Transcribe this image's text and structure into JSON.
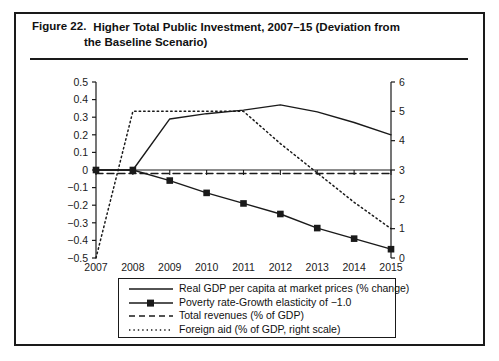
{
  "figure": {
    "number": "Figure 22.",
    "title_line1": "Higher Total Public Investment, 2007–15 (Deviation from",
    "title_line2": "the Baseline Scenario)"
  },
  "chart_data": {
    "type": "line",
    "title": "Higher Total Public Investment, 2007–15 (Deviation from the Baseline Scenario)",
    "xlabel": "",
    "ylabel": "",
    "categories": [
      "2007",
      "2008",
      "2009",
      "2010",
      "2011",
      "2012",
      "2013",
      "2014",
      "2015"
    ],
    "x": [
      2007,
      2008,
      2009,
      2010,
      2011,
      2012,
      2013,
      2014,
      2015
    ],
    "ylim": [
      -0.5,
      0.5
    ],
    "yticks": [
      "0.5",
      "0.4",
      "0.3",
      "0.2",
      "0.1",
      "0",
      "−0.1",
      "−0.2",
      "−0.3",
      "−0.4",
      "−0.5"
    ],
    "ytick_values": [
      0.5,
      0.4,
      0.3,
      0.2,
      0.1,
      0,
      -0.1,
      -0.2,
      -0.3,
      -0.4,
      -0.5
    ],
    "y2lim": [
      0,
      6
    ],
    "y2ticks": [
      "6",
      "5",
      "4",
      "3",
      "2",
      "1",
      "0"
    ],
    "y2tick_values": [
      6,
      5,
      4,
      3,
      2,
      1,
      0
    ],
    "grid": false,
    "legend_position": "bottom",
    "series": [
      {
        "name": "Real GDP per capita at market prices (% change)",
        "axis": "left",
        "style": "solid",
        "marker": "none",
        "values": [
          0,
          0,
          0.29,
          0.32,
          0.34,
          0.37,
          0.33,
          0.27,
          0.2
        ]
      },
      {
        "name": "Poverty rate-Growth elasticity of −1.0",
        "axis": "left",
        "style": "solid",
        "marker": "square",
        "values": [
          0,
          0,
          -0.06,
          -0.13,
          -0.19,
          -0.25,
          -0.33,
          -0.39,
          -0.45
        ]
      },
      {
        "name": "Total revenues (% of GDP)",
        "axis": "left",
        "style": "dashed",
        "marker": "none",
        "values": [
          -0.02,
          -0.02,
          -0.02,
          -0.02,
          -0.02,
          -0.02,
          -0.02,
          -0.02,
          -0.02
        ]
      },
      {
        "name": "Foreign aid (% of GDP, right scale)",
        "axis": "right",
        "style": "dotted",
        "marker": "none",
        "values": [
          0.0,
          5.0,
          5.0,
          5.0,
          5.0,
          3.9,
          2.9,
          1.9,
          1.0
        ]
      }
    ],
    "zero_line": 0
  },
  "legend": {
    "items": [
      {
        "label": "Real GDP per capita at market prices (% change)",
        "style": "solid",
        "marker": "none"
      },
      {
        "label": "Poverty rate-Growth elasticity of −1.0",
        "style": "solid",
        "marker": "square"
      },
      {
        "label": "Total revenues (% of GDP)",
        "style": "dashed",
        "marker": "none"
      },
      {
        "label": "Foreign aid (% of GDP, right scale)",
        "style": "dotted",
        "marker": "none"
      }
    ]
  },
  "colors": {
    "ink": "#1a1a1a",
    "background": "#ffffff"
  }
}
